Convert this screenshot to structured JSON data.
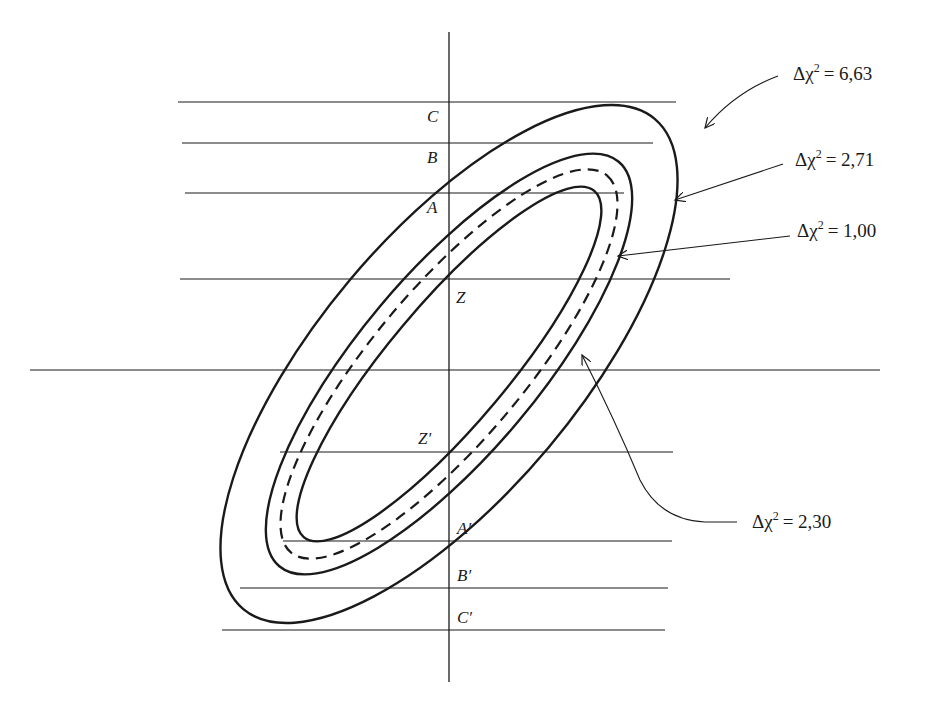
{
  "figure": {
    "type": "confidence-region-diagram",
    "axis_labels": {
      "C": "C",
      "B": "B",
      "A": "A",
      "Z": "Z",
      "Z_prime": "Z′",
      "A_prime": "A′",
      "B_prime": "B′",
      "C_prime": "C′"
    },
    "contours": [
      {
        "id": "inner",
        "delta_chi2_label": "Δχ² = 1,00",
        "prefix": "Δχ",
        "exp": "2",
        "value": "= 1,00",
        "style": "solid"
      },
      {
        "id": "dashed",
        "delta_chi2_label": "Δχ² = 2,30",
        "prefix": "Δχ",
        "exp": "2",
        "value": "= 2,30",
        "style": "dashed"
      },
      {
        "id": "middle",
        "delta_chi2_label": "Δχ² = 2,71",
        "prefix": "Δχ",
        "exp": "2",
        "value": "= 2,71",
        "style": "solid"
      },
      {
        "id": "outer",
        "delta_chi2_label": "Δχ² = 6,63",
        "prefix": "Δχ",
        "exp": "2",
        "value": "= 6,63",
        "style": "solid"
      }
    ],
    "colors": {
      "ink": "#1a1a1a",
      "background": "#ffffff"
    }
  }
}
